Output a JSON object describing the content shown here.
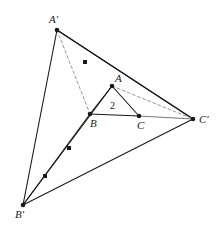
{
  "figure": {
    "width": 220,
    "height": 231,
    "background_color": "#ffffff",
    "stroke_color": "#1a1a1a",
    "dashed_color": "#999999",
    "gray_segment_color": "#7a7a7a"
  },
  "labels": {
    "a_prime": "A′",
    "b_prime": "B′",
    "c_prime": "C′",
    "a": "A",
    "b": "B",
    "c": "C",
    "length_two": "2"
  },
  "chart_data": {
    "type": "diagram",
    "points": [
      {
        "name": "A'",
        "label": "A′",
        "x": 57,
        "y": 30,
        "dot": true,
        "label_x": 49,
        "label_y": 14
      },
      {
        "name": "B'",
        "label": "B′",
        "x": 23,
        "y": 205,
        "dot": true,
        "label_x": 15,
        "label_y": 209
      },
      {
        "name": "C'",
        "label": "C′",
        "x": 193,
        "y": 119,
        "dot": true,
        "label_x": 199,
        "label_y": 114
      },
      {
        "name": "A",
        "label": "A",
        "x": 112,
        "y": 86,
        "dot": true,
        "label_x": 115,
        "label_y": 73
      },
      {
        "name": "B",
        "label": "B",
        "x": 90,
        "y": 114,
        "dot": true,
        "label_x": 90,
        "label_y": 118
      },
      {
        "name": "C",
        "label": "C",
        "x": 139,
        "y": 116,
        "dot": true,
        "label_x": 137,
        "label_y": 120
      }
    ],
    "midpoint_dots": [
      {
        "name": "midpoint-a-prime-c-prime",
        "x": 85,
        "y": 62
      },
      {
        "name": "midpoint-b-prime-a",
        "x": 69,
        "y": 148
      },
      {
        "name": "midpoint-b-prime-b",
        "x": 45,
        "y": 176
      }
    ],
    "solid_segments": [
      {
        "name": "A'-B'",
        "from": "A'",
        "to": "B'",
        "x1": 57,
        "y1": 30,
        "x2": 23,
        "y2": 205,
        "color": "#1a1a1a"
      },
      {
        "name": "A'-C'",
        "from": "A'",
        "to": "C'",
        "x1": 57,
        "y1": 30,
        "x2": 193,
        "y2": 119,
        "color": "#1a1a1a"
      },
      {
        "name": "B'-C'",
        "from": "B'",
        "to": "C'",
        "x1": 23,
        "y1": 205,
        "x2": 193,
        "y2": 119,
        "color": "#1a1a1a"
      },
      {
        "name": "A'-A-C-C'",
        "from": "A'",
        "to": "C'",
        "x1": 57,
        "y1": 30,
        "x2": 193,
        "y2": 119,
        "color": "#1a1a1a"
      },
      {
        "name": "B'-A",
        "from": "B'",
        "to": "A",
        "x1": 23,
        "y1": 205,
        "x2": 112,
        "y2": 86,
        "color": "#1a1a1a"
      },
      {
        "name": "B'-B",
        "from": "B'",
        "to": "B",
        "x1": 23,
        "y1": 205,
        "x2": 90,
        "y2": 114,
        "color": "#1a1a1a"
      },
      {
        "name": "A-B",
        "from": "A",
        "to": "B",
        "x1": 112,
        "y1": 86,
        "x2": 90,
        "y2": 114,
        "color": "#1a1a1a"
      },
      {
        "name": "A-C",
        "from": "A",
        "to": "C",
        "x1": 112,
        "y1": 86,
        "x2": 139,
        "y2": 116,
        "color": "#1a1a1a"
      },
      {
        "name": "B-C",
        "from": "B",
        "to": "C",
        "x1": 90,
        "y1": 114,
        "x2": 139,
        "y2": 116,
        "color": "#1a1a1a"
      },
      {
        "name": "C-C'",
        "from": "C",
        "to": "C'",
        "x1": 139,
        "y1": 116,
        "x2": 193,
        "y2": 119,
        "color": "#7a7a7a"
      }
    ],
    "dashed_segments": [
      {
        "name": "A'-B-dashed",
        "from": "A'",
        "to": "B",
        "x1": 57,
        "y1": 30,
        "x2": 90,
        "y2": 114,
        "color": "#999999"
      },
      {
        "name": "A-C'-dashed",
        "from": "A",
        "to": "C'",
        "x1": 112,
        "y1": 86,
        "x2": 193,
        "y2": 119,
        "color": "#999999"
      }
    ],
    "annotations": [
      {
        "name": "length-label-2",
        "text": "2",
        "x": 110,
        "y": 101
      }
    ]
  }
}
